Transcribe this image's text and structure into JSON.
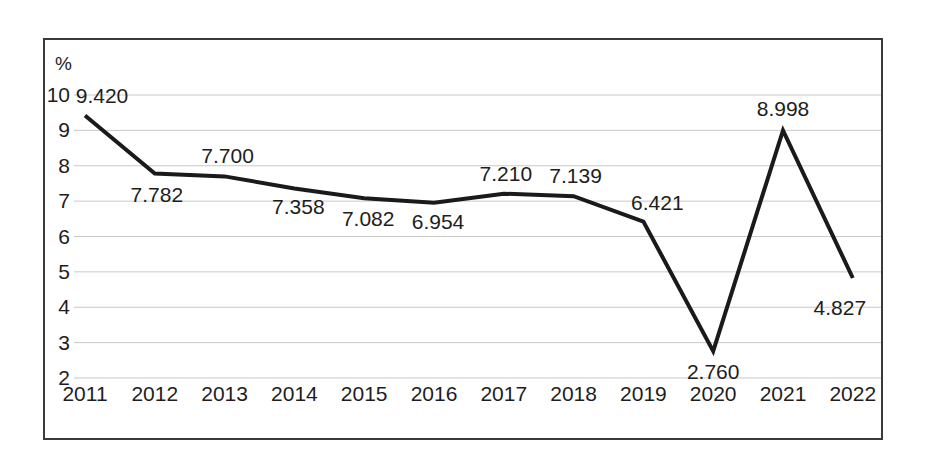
{
  "chart_data": {
    "type": "line",
    "title": "",
    "subtitle": "",
    "xlabel": "",
    "ylabel": "%",
    "unit_label": "%",
    "categories": [
      "2011",
      "2012",
      "2013",
      "2014",
      "2015",
      "2016",
      "2017",
      "2018",
      "2019",
      "2020",
      "2021",
      "2022"
    ],
    "values": [
      9.42,
      7.782,
      7.7,
      7.358,
      7.082,
      6.954,
      7.21,
      7.139,
      6.421,
      2.76,
      8.998,
      4.827
    ],
    "data_labels": [
      "9.420",
      "7.782",
      "7.700",
      "7.358",
      "7.082",
      "6.954",
      "7.210",
      "7.139",
      "6.421",
      "2.760",
      "8.998",
      "4.827"
    ],
    "label_positions": [
      "above",
      "below",
      "above",
      "below",
      "below",
      "below",
      "above",
      "above",
      "above",
      "below",
      "above",
      "below"
    ],
    "ylim": [
      2,
      10
    ],
    "yticks": [
      "10",
      "9",
      "8",
      "7",
      "6",
      "5",
      "4",
      "3",
      "2"
    ],
    "ytick_values": [
      10,
      9,
      8,
      7,
      6,
      5,
      4,
      3,
      2
    ],
    "grid": true,
    "grid_axis": "y",
    "legend": null,
    "legend_position": "none",
    "series": [
      {
        "name": "",
        "values": [
          9.42,
          7.782,
          7.7,
          7.358,
          7.082,
          6.954,
          7.21,
          7.139,
          6.421,
          2.76,
          8.998,
          4.827
        ],
        "color": "#1a1a1a",
        "line_width": 4,
        "markers": false
      }
    ],
    "colors": {
      "line": "#1a1a1a",
      "grid": "#c9c9c9",
      "frame": "#3a3a3a",
      "text": "#1d1d1d",
      "background": "#ffffff"
    }
  }
}
